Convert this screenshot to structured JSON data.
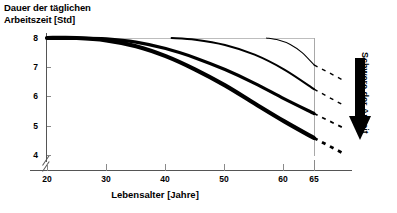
{
  "chart_data": {
    "type": "line",
    "title": "Dauer der täglichen Arbeitszeit [Std]",
    "title_line1": "Dauer der täglichen",
    "title_line2": "Arbeitszeit [Std]",
    "xlabel": "Lebensalter [Jahre]",
    "ylabel": "Dauer der täglichen Arbeitszeit [Std]",
    "right_annotation": "Schwere der Arbeit",
    "right_annotation_arrow": "down-arrow",
    "xlim": [
      17,
      68
    ],
    "ylim": [
      3.85,
      8.25
    ],
    "y_axis_break": true,
    "grid": false,
    "legend": "none",
    "xticks": [
      20,
      30,
      40,
      50,
      60,
      65
    ],
    "xtick_labels": [
      "20",
      "30",
      "40",
      "50",
      "60",
      "65"
    ],
    "yticks": [
      8,
      7,
      6,
      5,
      4
    ],
    "ytick_labels": [
      "8",
      "7",
      "6",
      "5",
      "4"
    ],
    "series": [
      {
        "name": "sehr schwere Arbeit",
        "line_weight": 4.2,
        "points": [
          [
            20,
            8.0
          ],
          [
            25,
            8.0
          ],
          [
            30,
            7.92
          ],
          [
            35,
            7.72
          ],
          [
            40,
            7.38
          ],
          [
            45,
            6.92
          ],
          [
            50,
            6.38
          ],
          [
            55,
            5.76
          ],
          [
            60,
            5.15
          ],
          [
            65,
            4.58
          ]
        ],
        "dashed_extension": [
          [
            65,
            4.58
          ],
          [
            70,
            4.05
          ]
        ]
      },
      {
        "name": "schwere Arbeit",
        "line_weight": 3.2,
        "points": [
          [
            20,
            8.0
          ],
          [
            25,
            8.0
          ],
          [
            30,
            7.97
          ],
          [
            35,
            7.86
          ],
          [
            40,
            7.64
          ],
          [
            45,
            7.32
          ],
          [
            50,
            6.92
          ],
          [
            55,
            6.45
          ],
          [
            60,
            5.92
          ],
          [
            65,
            5.42
          ]
        ],
        "dashed_extension": [
          [
            65,
            5.42
          ],
          [
            70,
            4.92
          ]
        ]
      },
      {
        "name": "mittelschwere Arbeit",
        "line_weight": 2.0,
        "points": [
          [
            41,
            8.0
          ],
          [
            45,
            7.94
          ],
          [
            50,
            7.76
          ],
          [
            55,
            7.43
          ],
          [
            60,
            6.92
          ],
          [
            65,
            6.25
          ]
        ],
        "dashed_extension": [
          [
            65,
            6.25
          ],
          [
            70,
            5.7
          ]
        ]
      },
      {
        "name": "leichte Arbeit",
        "line_weight": 1.1,
        "points": [
          [
            57,
            8.0
          ],
          [
            59,
            7.93
          ],
          [
            61,
            7.78
          ],
          [
            63,
            7.5
          ],
          [
            65,
            7.08
          ]
        ],
        "dashed_extension": [
          [
            65,
            7.08
          ],
          [
            70,
            6.55
          ]
        ]
      }
    ],
    "colors": {
      "curve": "#000000",
      "axis": "#555555",
      "frame": "#b0b0b0",
      "background": "#ffffff"
    }
  }
}
